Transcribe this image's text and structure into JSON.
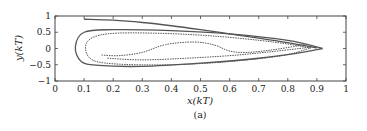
{
  "chart_data": {
    "type": "line",
    "title": "",
    "caption": "(a)",
    "xlabel": "x(kT)",
    "ylabel": "y(kT)",
    "xlim": [
      0,
      1
    ],
    "ylim": [
      -1,
      1
    ],
    "grid": false,
    "legend": "none",
    "xticks": [
      0,
      0.1,
      0.2,
      0.3,
      0.4,
      0.5,
      0.6,
      0.7,
      0.8,
      0.9,
      1
    ],
    "xtick_labels": [
      "0",
      "0.1",
      "0.2",
      "0.3",
      "0.4",
      "0.5",
      "0.6",
      "0.7",
      "0.8",
      "0.9",
      "1"
    ],
    "yticks": [
      1,
      0.5,
      0,
      -0.5,
      -1
    ],
    "ytick_labels": [
      "1",
      "0.5",
      "0",
      "−0.5",
      "−1"
    ],
    "series": [
      {
        "name": "upper-branch",
        "style": "solid",
        "color": "#444444",
        "x": [
          0.1,
          0.2,
          0.3,
          0.4,
          0.5,
          0.6,
          0.7,
          0.8,
          0.9
        ],
        "y": [
          0.9,
          0.87,
          0.8,
          0.7,
          0.58,
          0.45,
          0.32,
          0.18,
          0.02
        ]
      },
      {
        "name": "outer-loop",
        "style": "solid",
        "color": "#444444",
        "x": [
          0.92,
          0.8,
          0.6,
          0.4,
          0.2,
          0.1,
          0.07,
          0.09,
          0.15,
          0.3,
          0.5,
          0.7,
          0.85,
          0.92
        ],
        "y": [
          0.0,
          0.25,
          0.45,
          0.55,
          0.58,
          0.5,
          0.05,
          -0.4,
          -0.52,
          -0.55,
          -0.45,
          -0.3,
          -0.12,
          0.0
        ]
      },
      {
        "name": "second-loop",
        "style": "dotted",
        "color": "#666666",
        "x": [
          0.88,
          0.75,
          0.55,
          0.35,
          0.18,
          0.11,
          0.12,
          0.2,
          0.4,
          0.6,
          0.78,
          0.88
        ],
        "y": [
          0.02,
          0.2,
          0.38,
          0.47,
          0.45,
          0.2,
          -0.3,
          -0.47,
          -0.5,
          -0.4,
          -0.22,
          0.02
        ]
      },
      {
        "name": "inner-spiral",
        "style": "dotted",
        "color": "#777777",
        "x": [
          0.16,
          0.22,
          0.3,
          0.38,
          0.48,
          0.55,
          0.6,
          0.66,
          0.74,
          0.82,
          0.86
        ],
        "y": [
          -0.2,
          -0.22,
          -0.12,
          0.12,
          0.2,
          0.1,
          -0.08,
          -0.12,
          -0.05,
          0.06,
          0.12
        ]
      },
      {
        "name": "inner-band",
        "style": "dotted",
        "color": "#888888",
        "x": [
          0.18,
          0.3,
          0.45,
          0.6,
          0.72,
          0.84,
          0.88
        ],
        "y": [
          -0.3,
          -0.35,
          -0.3,
          -0.22,
          -0.12,
          0.0,
          0.05
        ]
      }
    ]
  }
}
